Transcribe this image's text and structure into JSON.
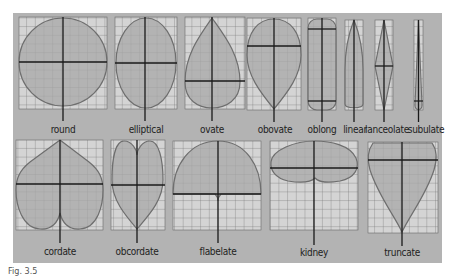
{
  "figure": {
    "colors": {
      "panel": "#b3b3b3",
      "grid_bg": "#d4d4d4",
      "grid_line": "#555555",
      "leaf_fill": "#a8a8a8",
      "leaf_outline": "#6e6e6e",
      "axis": "#1a1a1a"
    },
    "top_row": [
      {
        "label": "round"
      },
      {
        "label": "elliptical"
      },
      {
        "label": "ovate"
      },
      {
        "label": "obovate"
      },
      {
        "label": "oblong"
      },
      {
        "label": "linear"
      },
      {
        "label": "lanceolate"
      },
      {
        "label": "subulate"
      }
    ],
    "bottom_row": [
      {
        "label": "cordate"
      },
      {
        "label": "obcordate"
      },
      {
        "label": "flabelate"
      },
      {
        "label": "kidney"
      },
      {
        "label": "truncate"
      }
    ],
    "caption": "Fig. 3.5"
  }
}
